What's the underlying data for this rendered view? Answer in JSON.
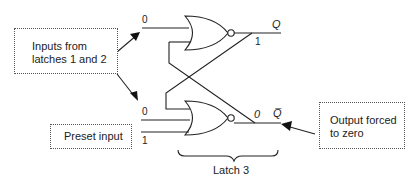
{
  "diagram": {
    "callouts": {
      "inputs_box": "Inputs from latches 1 and 2",
      "inputs_line1": "Inputs from",
      "inputs_line2": "latches 1 and 2",
      "preset_box": "Preset input",
      "output_box_line1": "Output forced",
      "output_box_line2": "to zero"
    },
    "signals": {
      "top_input": "0",
      "q_output_value": "1",
      "q_label": "Q",
      "bottom_input_a": "0",
      "bottom_input_b": "1",
      "qbar_output_value": "0",
      "qbar_label": "Q̅"
    },
    "brace_label": "Latch 3"
  }
}
